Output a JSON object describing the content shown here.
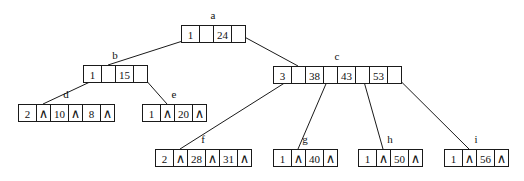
{
  "diagram": {
    "type": "B-tree",
    "null_symbol": "∧",
    "nodes": [
      {
        "id": "a",
        "label": "a",
        "cells": [
          {
            "kind": "count",
            "value": "1"
          },
          {
            "kind": "ptr"
          },
          {
            "kind": "key",
            "value": "24"
          },
          {
            "kind": "ptr"
          }
        ]
      },
      {
        "id": "b",
        "label": "b",
        "cells": [
          {
            "kind": "count",
            "value": "1"
          },
          {
            "kind": "ptr"
          },
          {
            "kind": "key",
            "value": "15"
          },
          {
            "kind": "ptr"
          }
        ]
      },
      {
        "id": "c",
        "label": "c",
        "cells": [
          {
            "kind": "count",
            "value": "3"
          },
          {
            "kind": "ptr"
          },
          {
            "kind": "key",
            "value": "38"
          },
          {
            "kind": "ptr"
          },
          {
            "kind": "key",
            "value": "43"
          },
          {
            "kind": "ptr"
          },
          {
            "kind": "key",
            "value": "53"
          },
          {
            "kind": "ptr"
          }
        ]
      },
      {
        "id": "d",
        "label": "d",
        "cells": [
          {
            "kind": "count",
            "value": "2"
          },
          {
            "kind": "null"
          },
          {
            "kind": "key",
            "value": "10"
          },
          {
            "kind": "null"
          },
          {
            "kind": "key",
            "value": "8"
          },
          {
            "kind": "null"
          }
        ]
      },
      {
        "id": "e",
        "label": "e",
        "cells": [
          {
            "kind": "count",
            "value": "1"
          },
          {
            "kind": "null"
          },
          {
            "kind": "key",
            "value": "20"
          },
          {
            "kind": "null"
          }
        ]
      },
      {
        "id": "f",
        "label": "f",
        "cells": [
          {
            "kind": "count",
            "value": "2"
          },
          {
            "kind": "null"
          },
          {
            "kind": "key",
            "value": "28"
          },
          {
            "kind": "null"
          },
          {
            "kind": "key",
            "value": "31"
          },
          {
            "kind": "null"
          }
        ]
      },
      {
        "id": "g",
        "label": "g",
        "cells": [
          {
            "kind": "count",
            "value": "1"
          },
          {
            "kind": "null"
          },
          {
            "kind": "key",
            "value": "40"
          },
          {
            "kind": "null"
          }
        ]
      },
      {
        "id": "h",
        "label": "h",
        "cells": [
          {
            "kind": "count",
            "value": "1"
          },
          {
            "kind": "null"
          },
          {
            "kind": "key",
            "value": "50"
          },
          {
            "kind": "null"
          }
        ]
      },
      {
        "id": "i",
        "label": "i",
        "cells": [
          {
            "kind": "count",
            "value": "1"
          },
          {
            "kind": "null"
          },
          {
            "kind": "key",
            "value": "56"
          },
          {
            "kind": "null"
          }
        ]
      }
    ],
    "edges": [
      {
        "from": "a",
        "from_ptr": 0,
        "to": "b"
      },
      {
        "from": "a",
        "from_ptr": 1,
        "to": "c"
      },
      {
        "from": "b",
        "from_ptr": 0,
        "to": "d"
      },
      {
        "from": "b",
        "from_ptr": 1,
        "to": "e"
      },
      {
        "from": "c",
        "from_ptr": 0,
        "to": "f"
      },
      {
        "from": "c",
        "from_ptr": 1,
        "to": "g"
      },
      {
        "from": "c",
        "from_ptr": 2,
        "to": "h"
      },
      {
        "from": "c",
        "from_ptr": 3,
        "to": "i"
      }
    ]
  }
}
